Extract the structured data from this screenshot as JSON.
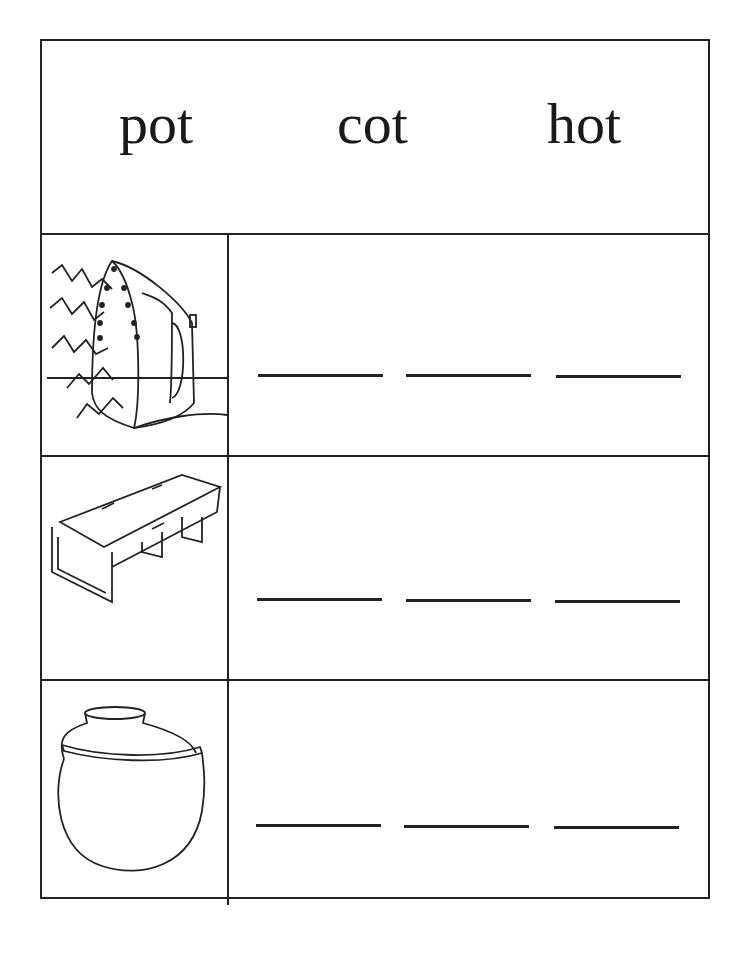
{
  "worksheet": {
    "word_bank": [
      "pot",
      "cot",
      "hot"
    ],
    "rows": [
      {
        "picture": "iron-icon",
        "blanks": 3
      },
      {
        "picture": "cot-icon",
        "blanks": 3
      },
      {
        "picture": "pot-icon",
        "blanks": 3
      }
    ]
  }
}
